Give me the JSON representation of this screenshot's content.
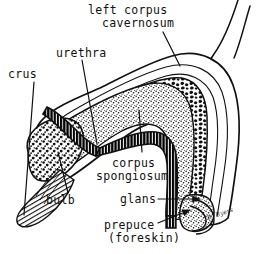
{
  "figure": {
    "kind": "anatomical-line-drawing",
    "background_color": "#ffffff",
    "ink_color": "#000000",
    "style": "pen-and-ink stipple / hatched medical illustration",
    "signature": "B. Byers"
  },
  "labels": {
    "left_corpus_cavernosum": {
      "line1": "left corpus",
      "line2": "cavernosum"
    },
    "urethra": "urethra",
    "crus": "crus",
    "corpus_spongiosum": {
      "line1": "corpus",
      "line2": "spongiosum"
    },
    "bulb": "bulb",
    "glans": "glans",
    "prepuce": {
      "line1": "prepuce",
      "line2": "(foreskin)"
    }
  },
  "structures": [
    {
      "name": "left corpus cavernosum",
      "texture": "dense mottled erectile tissue",
      "fill": "#000000"
    },
    {
      "name": "corpus spongiosum",
      "texture": "fine stipple",
      "fill": "#000000"
    },
    {
      "name": "urethra",
      "texture": "dark ribbed channel",
      "fill": "#000000"
    },
    {
      "name": "crus",
      "texture": "fine hatching, tapered tip",
      "fill": "#000000"
    },
    {
      "name": "bulb",
      "texture": "coarse stipple",
      "fill": "#000000"
    },
    {
      "name": "glans",
      "texture": "stippled cap",
      "fill": "#000000"
    },
    {
      "name": "prepuce (foreskin)",
      "texture": "outline fold",
      "fill": "#000000"
    }
  ],
  "leaders": [
    {
      "from": "left corpus cavernosum",
      "to_structure": "cavernosum body",
      "style": "plain line"
    },
    {
      "from": "urethra",
      "to_structure": "urethral channel",
      "style": "plain line"
    },
    {
      "from": "crus",
      "to_structure": "crus tip",
      "style": "plain line"
    },
    {
      "from": "corpus spongiosum",
      "to_structure": "spongiosum layer",
      "style": "plain line"
    },
    {
      "from": "bulb",
      "to_structure": "bulb",
      "style": "plain line"
    },
    {
      "from": "glans",
      "to_structure": "glans",
      "style": "arrow"
    },
    {
      "from": "prepuce (foreskin)",
      "to_structure": "foreskin fold",
      "style": "arrow"
    }
  ]
}
